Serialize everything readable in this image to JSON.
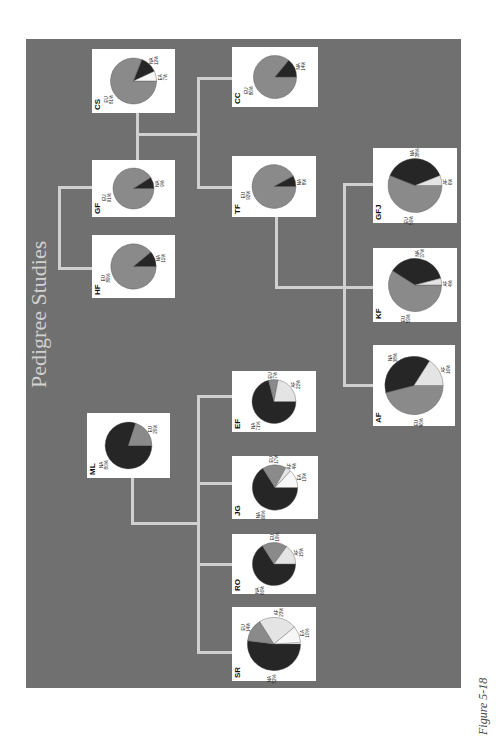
{
  "title": "Pedigree Studies",
  "caption": "Figure 5-18",
  "colors": {
    "panel": "#707070",
    "EU": "#8a8a8a",
    "NA": "#262626",
    "AF": "#e4e4e4",
    "EA": "#f7f7f7",
    "connector": "#d0d0d0"
  },
  "chart_data": {
    "type": "pie",
    "title": "Pedigree Studies",
    "note": "Pedigree tree of ancestry-composition pie charts per individual",
    "categories": [
      "EU",
      "NA",
      "AF",
      "EA"
    ],
    "nodes": [
      {
        "id": "CS",
        "slices": {
          "EU": 81,
          "NA": 12,
          "EA": 7
        }
      },
      {
        "id": "CC",
        "slices": {
          "EU": 86,
          "NA": 14
        }
      },
      {
        "id": "GF",
        "slices": {
          "EU": 91,
          "NA": 9
        }
      },
      {
        "id": "TF",
        "slices": {
          "EU": 92,
          "NA": 8
        }
      },
      {
        "id": "HF",
        "slices": {
          "EU": 89,
          "NA": 11
        }
      },
      {
        "id": "GFJ",
        "slices": {
          "EU": 56,
          "NA": 38,
          "AF": 6
        }
      },
      {
        "id": "KF",
        "slices": {
          "EU": 59,
          "NA": 37,
          "AF": 4
        }
      },
      {
        "id": "AF",
        "slices": {
          "EU": 46,
          "NA": 38,
          "AF": 16
        }
      },
      {
        "id": "EF",
        "slices": {
          "NA": 71,
          "EU": 7,
          "AF": 22
        }
      },
      {
        "id": "ML",
        "slices": {
          "NA": 80,
          "EU": 20
        }
      },
      {
        "id": "JG",
        "slices": {
          "NA": 66,
          "EU": 17,
          "AF": 4,
          "EA": 13
        }
      },
      {
        "id": "RO",
        "slices": {
          "NA": 66,
          "EU": 19,
          "AF": 15
        }
      },
      {
        "id": "SR",
        "slices": {
          "NA": 52,
          "EU": 14,
          "AF": 23,
          "EA": 10
        }
      }
    ],
    "edges": [
      [
        "CS",
        "CC",
        "TF"
      ],
      [
        "GF",
        "CS"
      ],
      [
        "GF",
        "HF"
      ],
      [
        "TF",
        "EF"
      ],
      [
        "TF",
        "GFJ"
      ],
      [
        "TF",
        "KF"
      ],
      [
        "TF",
        "AF"
      ],
      [
        "ML",
        "EF"
      ],
      [
        "ML",
        "JG"
      ],
      [
        "ML",
        "RO"
      ],
      [
        "ML",
        "SR"
      ]
    ]
  }
}
